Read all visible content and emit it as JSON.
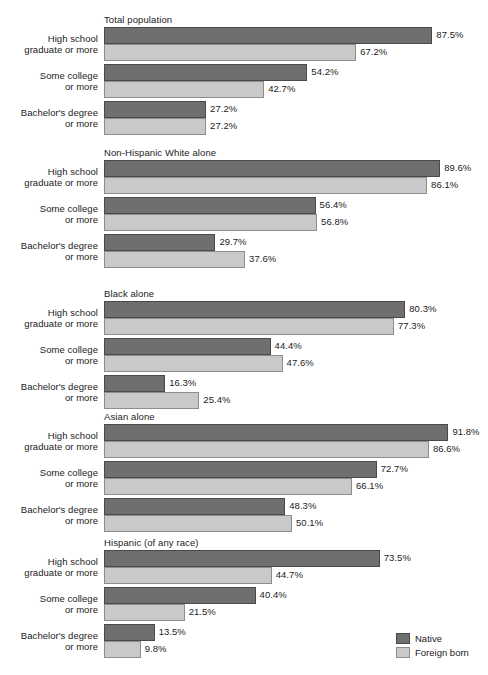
{
  "chart_data": {
    "type": "bar",
    "title": "",
    "xlabel": "",
    "ylabel": "",
    "orientation": "horizontal",
    "xlim": [
      0,
      100
    ],
    "grid": false,
    "legend_position": "bottom-right",
    "categories": [
      "High school graduate or more",
      "Some college or more",
      "Bachelor's degree or more"
    ],
    "series": [
      {
        "name": "Native",
        "color": "#6f6f6f"
      },
      {
        "name": "Foreign born",
        "color": "#c9c9c9"
      }
    ],
    "groups": [
      {
        "name": "Total population",
        "rows": [
          {
            "category_line1": "High school",
            "category_line2": "graduate or more",
            "native": 87.5,
            "foreign": 67.2,
            "native_label": "87.5%",
            "foreign_label": "67.2%"
          },
          {
            "category_line1": "Some college",
            "category_line2": "or more",
            "native": 54.2,
            "foreign": 42.7,
            "native_label": "54.2%",
            "foreign_label": "42.7%"
          },
          {
            "category_line1": "Bachelor's degree",
            "category_line2": "or more",
            "native": 27.2,
            "foreign": 27.2,
            "native_label": "27.2%",
            "foreign_label": "27.2%"
          }
        ]
      },
      {
        "name": "Non-Hispanic White alone",
        "rows": [
          {
            "category_line1": "High school",
            "category_line2": "graduate or more",
            "native": 89.6,
            "foreign": 86.1,
            "native_label": "89.6%",
            "foreign_label": "86.1%"
          },
          {
            "category_line1": "Some college",
            "category_line2": "or more",
            "native": 56.4,
            "foreign": 56.8,
            "native_label": "56.4%",
            "foreign_label": "56.8%"
          },
          {
            "category_line1": "Bachelor's degree",
            "category_line2": "or more",
            "native": 29.7,
            "foreign": 37.6,
            "native_label": "29.7%",
            "foreign_label": "37.6%"
          }
        ]
      },
      {
        "name": "Black alone",
        "rows": [
          {
            "category_line1": "High school",
            "category_line2": "graduate or more",
            "native": 80.3,
            "foreign": 77.3,
            "native_label": "80.3%",
            "foreign_label": "77.3%"
          },
          {
            "category_line1": "Some college",
            "category_line2": "or more",
            "native": 44.4,
            "foreign": 47.6,
            "native_label": "44.4%",
            "foreign_label": "47.6%"
          },
          {
            "category_line1": "Bachelor's degree",
            "category_line2": "or more",
            "native": 16.3,
            "foreign": 25.4,
            "native_label": "16.3%",
            "foreign_label": "25.4%"
          }
        ]
      },
      {
        "name": "Asian alone",
        "rows": [
          {
            "category_line1": "High school",
            "category_line2": "graduate or more",
            "native": 91.8,
            "foreign": 86.6,
            "native_label": "91.8%",
            "foreign_label": "86.6%"
          },
          {
            "category_line1": "Some college",
            "category_line2": "or more",
            "native": 72.7,
            "foreign": 66.1,
            "native_label": "72.7%",
            "foreign_label": "66.1%"
          },
          {
            "category_line1": "Bachelor's degree",
            "category_line2": "or more",
            "native": 48.3,
            "foreign": 50.1,
            "native_label": "48.3%",
            "foreign_label": "50.1%"
          }
        ]
      },
      {
        "name": "Hispanic (of any race)",
        "rows": [
          {
            "category_line1": "High school",
            "category_line2": "graduate or more",
            "native": 73.5,
            "foreign": 44.7,
            "native_label": "73.5%",
            "foreign_label": "44.7%"
          },
          {
            "category_line1": "Some college",
            "category_line2": "or more",
            "native": 40.4,
            "foreign": 21.5,
            "native_label": "40.4%",
            "foreign_label": "21.5%"
          },
          {
            "category_line1": "Bachelor's degree",
            "category_line2": "or more",
            "native": 13.5,
            "foreign": 9.8,
            "native_label": "13.5%",
            "foreign_label": "9.8%"
          }
        ]
      }
    ]
  },
  "legend": {
    "items": [
      {
        "label": "Native",
        "color": "#6f6f6f"
      },
      {
        "label": "Foreign born",
        "color": "#c9c9c9"
      }
    ]
  },
  "layout": {
    "bar_origin_x": 104,
    "px_per_percent": 3.752,
    "bar_height": 17,
    "group_top_offsets": [
      14,
      147,
      288,
      411,
      537
    ],
    "row_pitch": 37,
    "rows_start_offset": 13
  }
}
